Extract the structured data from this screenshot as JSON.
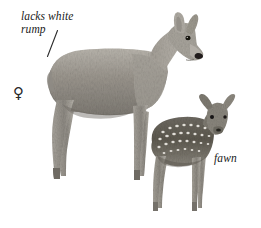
{
  "plate": {
    "width": 261,
    "height": 228,
    "background_color": "#ffffff",
    "subject": "deer-field-guide-plate"
  },
  "annotations": {
    "rump_label_line1": "lacks white",
    "rump_label_line2": "rump",
    "fawn_label": "fawn",
    "sex_symbol": "♀"
  },
  "colors": {
    "ink": "#1a1a1a",
    "adult_coat_mid": "#9a968f",
    "adult_coat_light": "#c6c2bb",
    "adult_coat_dark": "#6f6b65",
    "fawn_coat_dark": "#5c5850",
    "fawn_spot": "#ece9e3",
    "nose_black": "#201d1a",
    "eye_black": "#141210",
    "leader_line": "#2b2b2b"
  },
  "figures": {
    "adult": {
      "name": "adult-female-deer",
      "label": "♀"
    },
    "fawn": {
      "name": "spotted-fawn",
      "label": "fawn"
    }
  }
}
